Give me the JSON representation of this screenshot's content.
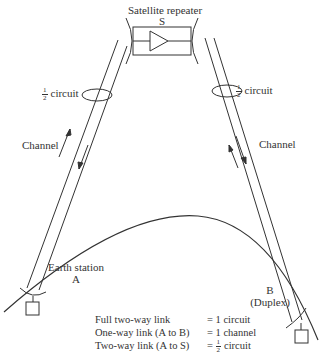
{
  "satellite": {
    "title": "Satellite repeater",
    "letter": "S"
  },
  "left_beam": {
    "circuit_num": "1",
    "circuit_den": "2",
    "circuit_text": "circuit",
    "channel_label": "Channel"
  },
  "right_beam": {
    "circuit_num": "1",
    "circuit_den": "2",
    "circuit_text": "circuit",
    "channel_label": "Channel"
  },
  "station_a": {
    "name": "Earth station",
    "letter": "A"
  },
  "station_b": {
    "letter": "B",
    "mode": "(Duplex)"
  },
  "legend": {
    "rows": [
      {
        "label": "Full two-way link",
        "equals": "= 1 circuit"
      },
      {
        "label": "One-way link (A to B)",
        "equals": "= 1 channel"
      },
      {
        "label": "Two-way link (A to S)",
        "equals_prefix": "=",
        "frac_num": "1",
        "frac_den": "2",
        "equals_suffix": "circuit"
      }
    ]
  }
}
